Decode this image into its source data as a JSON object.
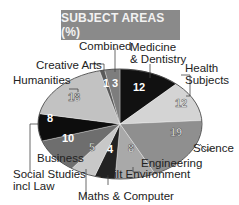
{
  "title": "SUBJECT AREAS (%)",
  "chart_data": {
    "type": "pie",
    "title": "SUBJECT AREAS (%)",
    "unit": "%",
    "slices": [
      {
        "label": "Medicine & Dentistry",
        "value": 12,
        "color": "#111111",
        "text_color": "#ffffff"
      },
      {
        "label": "Health Subjects",
        "value": 12,
        "color": "#d4d4d4",
        "text_color": "#ffffff"
      },
      {
        "label": "Science",
        "value": 19,
        "color": "#8f8f8f",
        "text_color": "#ffffff"
      },
      {
        "label": "Engineering",
        "value": 8,
        "color": "#a9a9a9",
        "text_color": "#ffffff"
      },
      {
        "label": "Built Environment",
        "value": 4,
        "color": "#222222",
        "text_color": "#ffffff"
      },
      {
        "label": "Maths & Computer",
        "value": 5,
        "color": "#c8c8c8",
        "text_color": "#ffffff"
      },
      {
        "label": "Business",
        "value": 10,
        "color": "#6e6e6e",
        "text_color": "#ffffff"
      },
      {
        "label": "Social Studies incl Law",
        "value": 8,
        "color": "#0d0d0d",
        "text_color": "#ffffff"
      },
      {
        "label": "Humanities",
        "value": 18,
        "color": "#c2c2c2",
        "text_color": "#ffffff"
      },
      {
        "label": "Creative Arts",
        "value": 1,
        "color": "#5a5a5a",
        "text_color": "#ffffff"
      },
      {
        "label": "Combined",
        "value": 3,
        "color": "#7d7d7d",
        "text_color": "#ffffff"
      }
    ],
    "legend": "none (callout labels)"
  },
  "labels": {
    "combined": "Combined",
    "medicine_1": "Medicine",
    "medicine_2": "& Dentistry",
    "creative_arts": "Creative Arts",
    "health_1": "Health",
    "health_2": "Subjects",
    "humanities": "Humanities",
    "science": "Science",
    "business": "Business",
    "engineering": "Engineering",
    "social_1": "Social Studies",
    "social_2": "incl Law",
    "built_env": "Built Environment",
    "maths": "Maths & Computer"
  },
  "values": {
    "medicine": "12",
    "health": "12",
    "science": "19",
    "engineering": "8",
    "built_env": "4",
    "maths": "5",
    "business": "10",
    "social": "8",
    "humanities": "18",
    "creative_arts": "1",
    "combined": "3"
  }
}
